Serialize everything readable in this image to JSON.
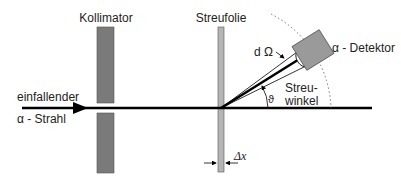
{
  "diagram": {
    "labels": {
      "collimator": "Kollimator",
      "foil": "Streufolie",
      "incident_line1": "einfallender",
      "incident_line2": "α - Strahl",
      "detector": "α - Detektor",
      "solid_angle": "d Ω",
      "scatter_angle_symbol": "ϑ",
      "scatter_angle_line1": "Streu-",
      "scatter_angle_line2": "winkel",
      "foil_thickness": "Δx"
    },
    "colors": {
      "collimator": "#7a7a7a",
      "foil": "#b5b5b5",
      "detector": "#9a9a9a",
      "beam": "#000000"
    }
  }
}
